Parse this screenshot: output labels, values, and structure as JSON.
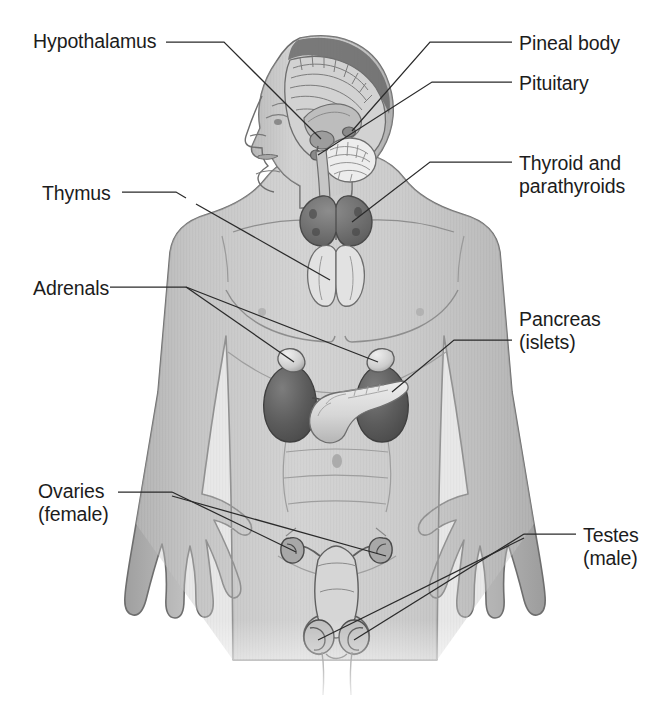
{
  "figure": {
    "style": "grayscale medical illustration with vertical hatching",
    "colors": {
      "background": "#ffffff",
      "body_fill": "#c9c9c9",
      "body_outline": "#6b6b6b",
      "organ_dark": "#5a5a5a",
      "organ_light": "#d8d8d8",
      "leader_line": "#2a2a2a",
      "text": "#1c1c1c"
    }
  },
  "labels": [
    {
      "id": "hypothalamus",
      "text": "Hypothalamus",
      "x": 33,
      "y": 30,
      "align": "left"
    },
    {
      "id": "pineal",
      "text": "Pineal body",
      "x": 519,
      "y": 32,
      "align": "left"
    },
    {
      "id": "pituitary",
      "text": "Pituitary",
      "x": 519,
      "y": 72,
      "align": "left"
    },
    {
      "id": "thyroid",
      "text": "Thyroid and\nparathyroids",
      "x": 519,
      "y": 152,
      "align": "left"
    },
    {
      "id": "thymus",
      "text": "Thymus",
      "x": 42,
      "y": 182,
      "align": "left"
    },
    {
      "id": "adrenals",
      "text": "Adrenals",
      "x": 33,
      "y": 277,
      "align": "left"
    },
    {
      "id": "pancreas",
      "text": "Pancreas\n(islets)",
      "x": 519,
      "y": 308,
      "align": "left"
    },
    {
      "id": "ovaries",
      "text": "Ovaries\n(female)",
      "x": 38,
      "y": 480,
      "align": "left"
    },
    {
      "id": "testes",
      "text": "Testes\n(male)",
      "x": 583,
      "y": 524,
      "align": "left"
    }
  ],
  "organs": [
    {
      "id": "hypothalamus-gland",
      "name": "Hypothalamus",
      "region": "brain, central"
    },
    {
      "id": "pineal-gland",
      "name": "Pineal body",
      "region": "brain, posterior midline"
    },
    {
      "id": "pituitary-gland",
      "name": "Pituitary",
      "region": "base of brain"
    },
    {
      "id": "thyroid-gland",
      "name": "Thyroid and parathyroids",
      "region": "neck, anterior"
    },
    {
      "id": "thymus-gland",
      "name": "Thymus",
      "region": "upper chest, behind sternum"
    },
    {
      "id": "adrenal-left",
      "name": "Adrenal gland (left)",
      "region": "atop left kidney"
    },
    {
      "id": "adrenal-right",
      "name": "Adrenal gland (right)",
      "region": "atop right kidney"
    },
    {
      "id": "pancreas-gland",
      "name": "Pancreas (islets)",
      "region": "upper abdomen"
    },
    {
      "id": "ovary-left",
      "name": "Ovary (left)",
      "region": "pelvis, female"
    },
    {
      "id": "ovary-right",
      "name": "Ovary (right)",
      "region": "pelvis, female"
    },
    {
      "id": "testis-left",
      "name": "Testis (left)",
      "region": "pelvis, male"
    },
    {
      "id": "testis-right",
      "name": "Testis (right)",
      "region": "pelvis, male"
    }
  ]
}
